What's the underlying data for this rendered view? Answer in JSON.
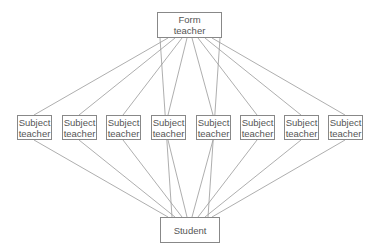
{
  "diagram": {
    "top": {
      "label_line1": "Form",
      "label_line2": "teacher"
    },
    "middle": [
      {
        "line1": "Subject",
        "line2": "teacher"
      },
      {
        "line1": "Subject",
        "line2": "teacher"
      },
      {
        "line1": "Subject",
        "line2": "teacher"
      },
      {
        "line1": "Subject",
        "line2": "teacher"
      },
      {
        "line1": "Subject",
        "line2": "teacher"
      },
      {
        "line1": "Subject",
        "line2": "teacher"
      },
      {
        "line1": "Subject",
        "line2": "teacher"
      },
      {
        "line1": "Subject",
        "line2": "teacher"
      }
    ],
    "bottom": {
      "label": "Student"
    },
    "colors": {
      "line": "#999999",
      "border": "#888888",
      "text": "#555555"
    }
  }
}
